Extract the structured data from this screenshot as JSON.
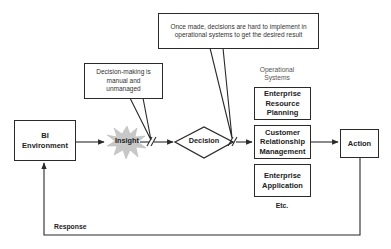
{
  "diagram": {
    "nodes": {
      "bi_environment": "BI Environment",
      "insight": "Insight",
      "decision": "Decision",
      "operational_systems_label": "Operational Systems",
      "erp": "Enterprise Resource Planning",
      "crm": "Customer Relationship Management",
      "enterprise_app": "Enterprise Application",
      "etc": "Etc.",
      "action": "Action"
    },
    "callouts": {
      "decision_making": "Decision-making is manual and unmanaged",
      "once_made": "Once made, decisions are hard to implement in operational systems to get the desired result"
    },
    "edges": {
      "response": "Response"
    },
    "colors": {
      "starburst": "#c8c8c8",
      "stroke": "#2a2a2a"
    }
  }
}
